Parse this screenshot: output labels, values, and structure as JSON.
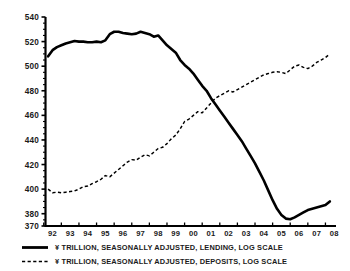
{
  "chart_data": {
    "type": "line",
    "title": "",
    "xlabel": "",
    "ylabel": "",
    "ylim": [
      370,
      540
    ],
    "xlim": [
      1991.6,
      2008.1
    ],
    "grid": false,
    "legend_position": "below-left",
    "y_ticks": [
      370,
      380,
      400,
      420,
      440,
      460,
      480,
      500,
      520,
      540
    ],
    "y_tick_labels": [
      "370",
      "380",
      "400",
      "420",
      "440",
      "460",
      "480",
      "500",
      "520",
      "540"
    ],
    "x_ticks": [
      1992,
      1993,
      1994,
      1995,
      1996,
      1997,
      1998,
      1999,
      2000,
      2001,
      2002,
      2003,
      2004,
      2005,
      2006,
      2007,
      2008
    ],
    "x_tick_labels": [
      "92",
      "93",
      "94",
      "95",
      "96",
      "97",
      "98",
      "99",
      "00",
      "01",
      "02",
      "03",
      "04",
      "05",
      "06",
      "07",
      "08"
    ],
    "units_note": "Yen trillion, seasonally adjusted, log scale",
    "series": [
      {
        "name": "¥ TRILLION, SEASONALLY ADJUSTED, LENDING, LOG SCALE",
        "short_name": "LENDING",
        "style": "solid",
        "color": "#000000",
        "x": [
          1991.75,
          1992.0,
          1992.25,
          1992.5,
          1992.75,
          1993.0,
          1993.25,
          1993.5,
          1993.75,
          1994.0,
          1994.25,
          1994.5,
          1994.75,
          1995.0,
          1995.25,
          1995.5,
          1995.75,
          1996.0,
          1996.25,
          1996.5,
          1996.75,
          1997.0,
          1997.25,
          1997.5,
          1997.75,
          1998.0,
          1998.25,
          1998.5,
          1998.75,
          1999.0,
          1999.25,
          1999.5,
          1999.75,
          2000.0,
          2000.25,
          2000.5,
          2000.75,
          2001.0,
          2001.25,
          2001.5,
          2001.75,
          2002.0,
          2002.25,
          2002.5,
          2002.75,
          2003.0,
          2003.25,
          2003.5,
          2003.75,
          2004.0,
          2004.25,
          2004.5,
          2004.75,
          2005.0,
          2005.25,
          2005.5,
          2005.75,
          2006.0,
          2006.25,
          2006.5,
          2006.75,
          2007.0,
          2007.25,
          2007.5,
          2007.75
        ],
        "values": [
          508,
          513,
          515.5,
          517,
          518.5,
          519.5,
          520.5,
          520,
          520,
          519.5,
          519.5,
          520,
          519.5,
          521,
          526,
          528,
          528,
          527,
          526.5,
          526,
          526.5,
          528,
          527,
          526,
          524,
          525,
          521,
          517,
          514,
          511,
          505,
          501,
          498,
          494,
          489,
          484,
          480,
          474,
          469,
          464,
          459,
          454,
          449,
          444,
          439,
          433,
          427,
          421,
          414,
          407,
          399,
          391,
          384,
          379,
          376,
          375.5,
          377,
          379,
          381,
          383,
          384,
          385,
          386,
          387,
          390
        ],
        "value_range": [
          375.5,
          528
        ]
      },
      {
        "name": "¥ TRILLION, SEASONALLY ADJUSTED, DEPOSITS, LOG SCALE",
        "short_name": "DEPOSITS",
        "style": "dashed",
        "color": "#000000",
        "x": [
          1991.75,
          1992.0,
          1992.25,
          1992.5,
          1992.75,
          1993.0,
          1993.25,
          1993.5,
          1993.75,
          1994.0,
          1994.25,
          1994.5,
          1994.75,
          1995.0,
          1995.25,
          1995.5,
          1995.75,
          1996.0,
          1996.25,
          1996.5,
          1996.75,
          1997.0,
          1997.25,
          1997.5,
          1997.75,
          1998.0,
          1998.25,
          1998.5,
          1998.75,
          1999.0,
          1999.25,
          1999.5,
          1999.75,
          2000.0,
          2000.25,
          2000.5,
          2000.75,
          2001.0,
          2001.25,
          2001.5,
          2001.75,
          2002.0,
          2002.25,
          2002.5,
          2002.75,
          2003.0,
          2003.25,
          2003.5,
          2003.75,
          2004.0,
          2004.25,
          2004.5,
          2004.75,
          2005.0,
          2005.25,
          2005.5,
          2005.75,
          2006.0,
          2006.25,
          2006.5,
          2006.75,
          2007.0,
          2007.25,
          2007.5,
          2007.75
        ],
        "values": [
          400,
          397,
          397.5,
          397,
          397.5,
          398,
          398.5,
          400,
          402,
          402.5,
          404.5,
          406,
          408,
          411,
          410,
          413,
          416,
          419,
          422,
          424,
          423.5,
          426,
          428,
          427,
          430,
          433,
          434,
          437,
          441,
          444,
          449,
          455,
          457,
          460,
          463,
          462,
          466,
          470,
          474,
          476,
          478,
          480,
          479,
          481,
          483,
          485,
          487,
          489,
          491,
          493,
          494,
          495,
          495.5,
          495,
          494,
          497,
          500,
          501,
          499,
          498,
          500,
          503,
          505,
          507,
          510
        ],
        "value_range": [
          397,
          510
        ]
      }
    ],
    "annotations": [
      {
        "text": "crossover",
        "x": 2000.1,
        "y": 462
      }
    ]
  },
  "legend": {
    "entries": [
      {
        "marker": "solid-line",
        "label": "¥ TRILLION, SEASONALLY ADJUSTED, LENDING, LOG SCALE"
      },
      {
        "marker": "dashed-line",
        "label": "¥ TRILLION, SEASONALLY ADJUSTED, DEPOSITS, LOG SCALE"
      }
    ]
  },
  "colors": {
    "background": "#ffffff",
    "axis": "#000000",
    "text": "#1a1a1a",
    "lending": "#000000",
    "deposits": "#000000"
  }
}
